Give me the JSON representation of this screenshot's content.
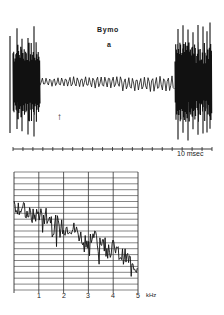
{
  "figure": {
    "oscillogram": {
      "title": "Bymo",
      "panel_label": "a",
      "arrow_symbol": "↑",
      "time_scale_label": "10 msec"
    },
    "spectrum": {
      "x_unit": "kHz",
      "x_ticks": [
        "1",
        "2",
        "3",
        "4",
        "5"
      ]
    }
  },
  "chart_data": [
    {
      "type": "line",
      "title": "Bymo",
      "panel": "a",
      "description": "Oscillogram: high-amplitude burst at start, low-amplitude steady oscillation in middle (onset marked by arrow), high-amplitude burst at end",
      "xlabel": "time",
      "ylabel": "amplitude",
      "scale_bar": "10 msec",
      "x_ticks_count": 20,
      "segments": [
        {
          "name": "initial burst",
          "x_range_px": [
            13,
            40
          ],
          "relative_amplitude": 1.0
        },
        {
          "name": "sustained low-amplitude oscillation",
          "x_range_px": [
            40,
            175
          ],
          "relative_amplitude": 0.1
        },
        {
          "name": "final burst",
          "x_range_px": [
            175,
            212
          ],
          "relative_amplitude": 1.0
        }
      ],
      "annotations": [
        {
          "text": "↑",
          "x_px": 60,
          "y_px": 118
        }
      ],
      "grid": false
    },
    {
      "type": "line",
      "title": "",
      "description": "Frequency spectrum, amplitude decreasing with frequency",
      "xlabel": "kHz",
      "ylabel": "",
      "x": [
        0.0,
        0.25,
        0.5,
        0.75,
        1.0,
        1.25,
        1.5,
        1.75,
        2.0,
        2.25,
        2.5,
        2.75,
        3.0,
        3.25,
        3.5,
        3.75,
        4.0,
        4.25,
        4.5,
        4.75,
        5.0
      ],
      "values": [
        0.72,
        0.7,
        0.66,
        0.62,
        0.65,
        0.66,
        0.6,
        0.56,
        0.52,
        0.54,
        0.5,
        0.44,
        0.42,
        0.46,
        0.42,
        0.38,
        0.36,
        0.3,
        0.28,
        0.24,
        0.18
      ],
      "xlim": [
        0,
        5
      ],
      "ylim": [
        0,
        1
      ],
      "x_ticks": [
        "1",
        "2",
        "3",
        "4",
        "5"
      ],
      "grid": true,
      "grid_horizontal_lines": 20,
      "grid_vertical_lines": 6
    }
  ]
}
